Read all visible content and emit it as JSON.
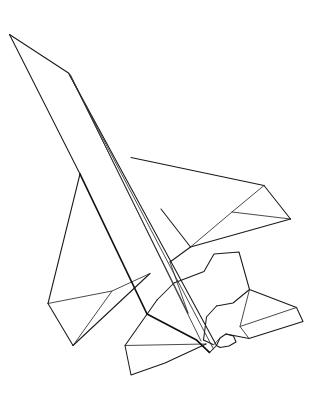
{
  "document": {
    "kind": "line-drawing",
    "subject": "fighter-jet-aircraft",
    "title": "Fighter Jet Line Drawing",
    "orientation": "three-quarter view from above and behind, nose pointing upper-left",
    "background_color": "#ffffff",
    "stroke_color": "#1a1a1a",
    "width": 321,
    "height": 415,
    "visible_text": []
  },
  "drawing": {
    "parts": [
      {
        "id": "fuselage-upper",
        "name": "fuselage-upper-surface",
        "path": "M 9.5 34.5 L 68.5 73.0 L 216.5 345.5 L 209.5 352.5 L 196.5 340.0 Z"
      },
      {
        "id": "fuselage-spine-a",
        "name": "fuselage-spine-line-a",
        "path": "M 68.5 73.0 L 213.5 349.0"
      },
      {
        "id": "fuselage-spine-b",
        "name": "fuselage-spine-line-b",
        "path": "M 70.0 74.5 L 199.0 338.0"
      },
      {
        "id": "canopy-ridge",
        "name": "canopy-ridge-line",
        "path": "M 69.0 73.5 L 186.0 310.0"
      },
      {
        "id": "nose-lower-edge",
        "name": "nose-lower-chine-edge",
        "path": "M 9.5 34.5 L 80.0 174.0"
      },
      {
        "id": "left-chine",
        "name": "left-fuselage-chine",
        "path": "M 80.0 174.0 L 147.0 314.0"
      },
      {
        "id": "right-wing-leading",
        "name": "right-wing-leading-edge",
        "path": "M 131.0 157.5 L 264.0 185.5"
      },
      {
        "id": "right-wing-tip-front",
        "name": "right-wing-tip-forward-edge",
        "path": "M 264.0 185.5 L 290.5 219.0"
      },
      {
        "id": "right-wing-trailing",
        "name": "right-wing-trailing-edge",
        "path": "M 290.5 219.0 L 190.5 247.0"
      },
      {
        "id": "right-wing-root-rear",
        "name": "right-wing-root-rear-edge",
        "path": "M 190.5 247.0 L 161.0 209.0"
      },
      {
        "id": "right-wing-fold",
        "name": "right-wing-tip-fold-line",
        "path": "M 264.0 185.5 L 232.0 212.0 L 190.5 247.0"
      },
      {
        "id": "right-wing-fold-inner",
        "name": "right-wing-inner-fold-line",
        "path": "M 232.0 212.0 L 290.5 219.0"
      },
      {
        "id": "right-wing-root-under",
        "name": "right-wing-root-under-edge",
        "path": "M 190.5 247.0 L 170.0 262.0"
      },
      {
        "id": "left-wing-leading",
        "name": "left-wing-leading-edge",
        "path": "M 80.0 174.0 L 48.0 303.5"
      },
      {
        "id": "left-wing-tip-rear",
        "name": "left-wing-tip-rear-edge",
        "path": "M 48.0 303.5 L 73.0 345.5"
      },
      {
        "id": "left-wing-trailing",
        "name": "left-wing-trailing-edge",
        "path": "M 73.0 345.5 L 150.0 273.5"
      },
      {
        "id": "left-wing-fold",
        "name": "left-wing-tip-fold-line",
        "path": "M 48.0 303.5 L 112.0 291.0 L 150.0 273.5"
      },
      {
        "id": "left-wing-fold-inner",
        "name": "left-wing-inner-fold-line",
        "path": "M 112.0 291.0 L 73.0 345.5"
      },
      {
        "id": "vertical-tail",
        "name": "vertical-stabilizer",
        "path": "M 174.0 283.0 L 204.0 271.5 L 214.0 254.0 L 239.0 252.0 L 249.5 289.5 L 233.0 303.0 L 216.5 306.0"
      },
      {
        "id": "vertical-tail-base",
        "name": "vertical-stabilizer-base-edge",
        "path": "M 216.5 306.0 L 206.5 317.0 L 203.5 340.0"
      },
      {
        "id": "right-tailplane",
        "name": "right-horizontal-stabilizer",
        "path": "M 249.5 289.5 L 296.5 307.5 L 303.0 321.5 L 249.0 338.5 L 226.0 334.0"
      },
      {
        "id": "right-tailplane-fold",
        "name": "right-horizontal-stabilizer-fold-line",
        "path": "M 249.5 289.5 L 240.0 326.5 L 249.0 338.5"
      },
      {
        "id": "right-tailplane-tip-line",
        "name": "right-horizontal-stabilizer-tip-line",
        "path": "M 296.5 307.5 L 240.0 326.5"
      },
      {
        "id": "exhaust-nozzle",
        "name": "engine-exhaust-nozzle",
        "path": "M 216.5 345.5 L 220.0 338.0 L 226.0 334.0 L 233.5 336.0 L 236.0 342.0 L 229.0 346.0 L 220.0 347.0 Z"
      },
      {
        "id": "ventral-fin",
        "name": "ventral-fin",
        "path": "M 157.0 300.0 L 125.0 345.5 L 131.0 375.0 L 165.0 363.0 L 206.0 344.0"
      },
      {
        "id": "ventral-fin-fold",
        "name": "ventral-fin-fold-line",
        "path": "M 125.0 345.5 L 206.0 344.0"
      },
      {
        "id": "rear-body-edge",
        "name": "rear-body-edge",
        "path": "M 174.0 283.0 L 157.0 300.0"
      },
      {
        "id": "wing-root-fillet-right",
        "name": "right-wing-root-fillet",
        "path": "M 170.0 262.0 L 186.0 310.0"
      },
      {
        "id": "tail-underside",
        "name": "tail-underside-edge",
        "path": "M 203.5 340.0 L 216.5 345.5"
      },
      {
        "id": "nozzle-detail",
        "name": "nozzle-detail-line",
        "path": "M 220.0 338.0 L 214.0 344.0"
      }
    ]
  }
}
